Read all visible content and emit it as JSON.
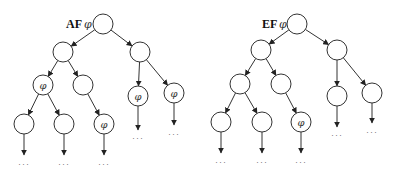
{
  "diagram": {
    "type": "computation-tree-logic",
    "symbols": {
      "phi": "φ",
      "ellipsis": "···"
    },
    "trees": [
      {
        "id": "af",
        "operator": "AF",
        "formula": "φ",
        "label": "AF φ",
        "nodes": [
          {
            "id": "r",
            "x": 103,
            "y": 24,
            "label": ""
          },
          {
            "id": "a",
            "x": 63,
            "y": 52,
            "label": ""
          },
          {
            "id": "b",
            "x": 140,
            "y": 52,
            "label": ""
          },
          {
            "id": "c",
            "x": 43,
            "y": 85,
            "label": "φ"
          },
          {
            "id": "d",
            "x": 83,
            "y": 85,
            "label": ""
          },
          {
            "id": "e",
            "x": 138,
            "y": 96,
            "label": "φ"
          },
          {
            "id": "f",
            "x": 174,
            "y": 93,
            "label": "φ"
          },
          {
            "id": "g",
            "x": 24,
            "y": 124,
            "label": ""
          },
          {
            "id": "h",
            "x": 64,
            "y": 124,
            "label": ""
          },
          {
            "id": "i",
            "x": 104,
            "y": 124,
            "label": "φ"
          }
        ],
        "edges": [
          [
            "r",
            "a"
          ],
          [
            "r",
            "b"
          ],
          [
            "a",
            "c"
          ],
          [
            "a",
            "d"
          ],
          [
            "b",
            "e"
          ],
          [
            "b",
            "f"
          ],
          [
            "c",
            "g"
          ],
          [
            "c",
            "h"
          ],
          [
            "d",
            "i"
          ]
        ],
        "continuations": [
          {
            "from": "g",
            "to_y": 155,
            "dots_y": 167
          },
          {
            "from": "h",
            "to_y": 155,
            "dots_y": 167
          },
          {
            "from": "i",
            "to_y": 155,
            "dots_y": 167
          },
          {
            "from": "e",
            "to_y": 130,
            "dots_y": 141
          },
          {
            "from": "f",
            "to_y": 125,
            "dots_y": 137
          }
        ]
      },
      {
        "id": "ef",
        "operator": "EF",
        "formula": "φ",
        "label": "EF φ",
        "nodes": [
          {
            "id": "r",
            "x": 297,
            "y": 24,
            "label": ""
          },
          {
            "id": "a",
            "x": 261,
            "y": 50,
            "label": ""
          },
          {
            "id": "b",
            "x": 337,
            "y": 50,
            "label": ""
          },
          {
            "id": "c",
            "x": 240,
            "y": 84,
            "label": ""
          },
          {
            "id": "d",
            "x": 281,
            "y": 84,
            "label": ""
          },
          {
            "id": "e",
            "x": 337,
            "y": 96,
            "label": ""
          },
          {
            "id": "f",
            "x": 372,
            "y": 93,
            "label": ""
          },
          {
            "id": "g",
            "x": 221,
            "y": 122,
            "label": ""
          },
          {
            "id": "h",
            "x": 262,
            "y": 122,
            "label": ""
          },
          {
            "id": "i",
            "x": 301,
            "y": 122,
            "label": "φ"
          }
        ],
        "edges": [
          [
            "r",
            "a"
          ],
          [
            "r",
            "b"
          ],
          [
            "a",
            "c"
          ],
          [
            "a",
            "d"
          ],
          [
            "b",
            "e"
          ],
          [
            "b",
            "f"
          ],
          [
            "c",
            "g"
          ],
          [
            "c",
            "h"
          ],
          [
            "d",
            "i"
          ]
        ],
        "continuations": [
          {
            "from": "g",
            "to_y": 153,
            "dots_y": 165
          },
          {
            "from": "h",
            "to_y": 153,
            "dots_y": 165
          },
          {
            "from": "i",
            "to_y": 153,
            "dots_y": 165
          },
          {
            "from": "e",
            "to_y": 127,
            "dots_y": 138
          },
          {
            "from": "f",
            "to_y": 123,
            "dots_y": 135
          }
        ]
      }
    ],
    "node_radius": 10
  }
}
